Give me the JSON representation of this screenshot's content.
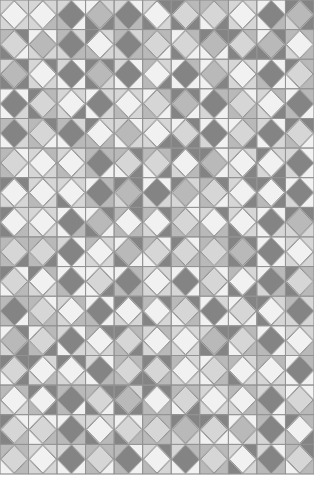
{
  "grid": {
    "columns": 11,
    "rows": 16,
    "cell_width": 28.5,
    "cell_height": 29.6,
    "width": 314,
    "height": 474
  },
  "palette": {
    "W": "#f1f1f1",
    "L": "#d6d6d6",
    "M": "#b9b9b9",
    "D": "#848484",
    "line": "#8f8f8f",
    "diamond_edge": "#9a9a9a",
    "background": "#ffffff"
  },
  "cells": [
    [
      "W",
      "W",
      "D",
      "M",
      "D",
      "W",
      "L",
      "L",
      "W",
      "D",
      "M"
    ],
    [
      "L",
      "M",
      "D",
      "W",
      "D",
      "L",
      "L",
      "M",
      "L",
      "M",
      "W"
    ],
    [
      "M",
      "W",
      "D",
      "M",
      "D",
      "W",
      "D",
      "M",
      "W",
      "D",
      "L"
    ],
    [
      "D",
      "L",
      "W",
      "D",
      "W",
      "L",
      "M",
      "D",
      "L",
      "W",
      "D"
    ],
    [
      "D",
      "L",
      "D",
      "W",
      "M",
      "W",
      "L",
      "D",
      "L",
      "D",
      "L"
    ],
    [
      "L",
      "W",
      "W",
      "D",
      "L",
      "L",
      "W",
      "M",
      "W",
      "W",
      "D"
    ],
    [
      "W",
      "W",
      "W",
      "D",
      "M",
      "D",
      "M",
      "L",
      "W",
      "W",
      "D"
    ],
    [
      "W",
      "W",
      "D",
      "M",
      "W",
      "W",
      "L",
      "W",
      "W",
      "D",
      "M"
    ],
    [
      "L",
      "L",
      "D",
      "W",
      "M",
      "L",
      "L",
      "L",
      "M",
      "D",
      "W"
    ],
    [
      "L",
      "W",
      "D",
      "L",
      "D",
      "W",
      "D",
      "L",
      "W",
      "D",
      "L"
    ],
    [
      "D",
      "L",
      "W",
      "D",
      "W",
      "W",
      "L",
      "D",
      "L",
      "W",
      "D"
    ],
    [
      "M",
      "L",
      "D",
      "W",
      "L",
      "W",
      "W",
      "M",
      "L",
      "D",
      "W"
    ],
    [
      "L",
      "W",
      "W",
      "D",
      "L",
      "L",
      "W",
      "L",
      "W",
      "W",
      "D"
    ],
    [
      "W",
      "W",
      "D",
      "L",
      "M",
      "W",
      "L",
      "W",
      "W",
      "D",
      "L"
    ],
    [
      "L",
      "L",
      "D",
      "W",
      "L",
      "L",
      "M",
      "L",
      "M",
      "D",
      "W"
    ],
    [
      "L",
      "W",
      "D",
      "L",
      "D",
      "W",
      "D",
      "L",
      "W",
      "D",
      "L"
    ]
  ]
}
